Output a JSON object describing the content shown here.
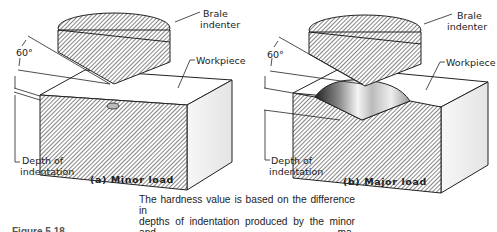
{
  "figure": {
    "panels": [
      {
        "id": "a",
        "subtitle": "(a) Minor load",
        "labels": {
          "indenter": [
            "Brale",
            "indenter"
          ],
          "workpiece": "Workpiece",
          "angle": "60°",
          "depth": [
            "Depth of",
            "indentation"
          ]
        }
      },
      {
        "id": "b",
        "subtitle": "(b) Major load",
        "labels": {
          "indenter": [
            "Brale",
            "indenter"
          ],
          "workpiece": "Workpiece",
          "angle": "60°",
          "depth": [
            "Depth of",
            "indentation"
          ]
        }
      }
    ],
    "caption": "The hardness value is based on the difference in depths of indentation produced by the minor and major loads.",
    "caption_lines": [
      "The hardness value is based on the difference in",
      "depths of indentation produced by the minor and ma-",
      "jor loads."
    ],
    "figure_caption_truncated": "Figure 5.18 …"
  },
  "colors": {
    "ink": "#222222",
    "hatch": "#555555",
    "face_light": "#f2f2f2",
    "background": "#ffffff"
  }
}
